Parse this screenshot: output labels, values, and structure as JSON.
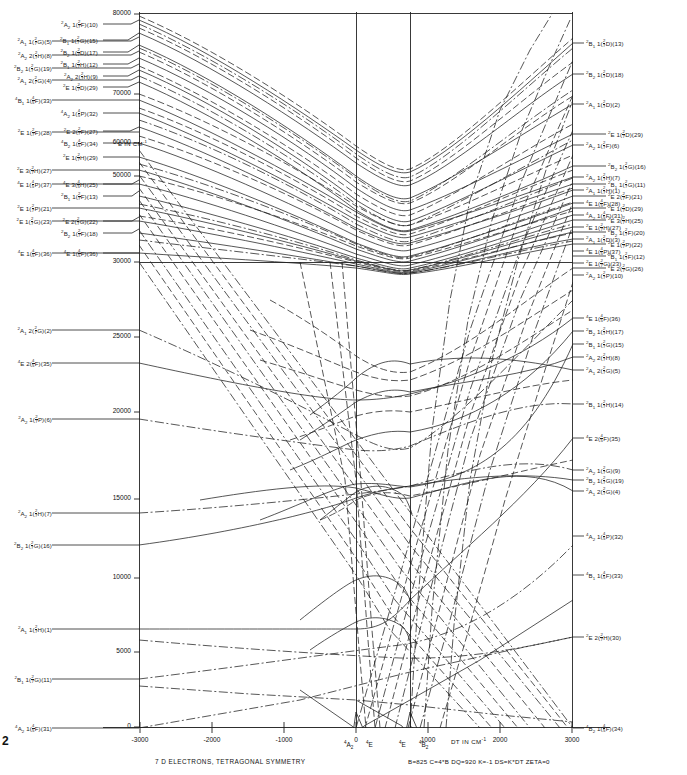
{
  "figure": {
    "caption": "7 D ELECTRONS, TETRAGONAL SYMMETRY",
    "parameters": "B=825   C=4*B   DQ=920    K=-1  DS=K*DT   ZETA=0",
    "page_number": "2",
    "energy_axis_note": "E IN CM",
    "energy_axis_note_sup": "-1",
    "xaxis_title": "DT IN CM",
    "xaxis_title_sup": "-1",
    "crossing_labels": [
      {
        "text": "4A2",
        "super": "4",
        "main": "A",
        "sub": "2",
        "x": 352,
        "y": 741
      },
      {
        "text": "4E",
        "super": "4",
        "main": "E",
        "sub": "",
        "x": 372,
        "y": 741
      },
      {
        "text": "4E",
        "super": "4",
        "main": "E",
        "sub": "",
        "x": 409,
        "y": 741
      },
      {
        "text": "4B2",
        "super": "4",
        "main": "B",
        "sub": "2",
        "x": 428,
        "y": 741
      }
    ]
  },
  "chart_data": {
    "type": "line",
    "title": "7 D ELECTRONS, TETRAGONAL SYMMETRY",
    "xlabel": "DT IN CM-1",
    "ylabel": "E IN CM-1",
    "xlim": [
      -3500,
      3500
    ],
    "ylim": [
      0,
      80000
    ],
    "xticks": [
      -3000,
      -2000,
      -1000,
      0,
      1000,
      2000,
      3000
    ],
    "xtick_labels": [
      "-3000",
      "-2000",
      "-1000",
      "0",
      "1000",
      "2000",
      "3000"
    ],
    "yticks": [
      0,
      5000,
      10000,
      15000,
      20000,
      25000,
      30000,
      50000,
      60000,
      70000,
      80000
    ],
    "ytick_labels": [
      "0",
      "5000",
      "10000",
      "15000",
      "20000",
      "25000",
      "30000",
      "50000",
      "60000",
      "70000",
      "80000"
    ],
    "grid": "vertical gridlines at -500, 0, 3000; horizontal at 30000",
    "legend": "none"
  },
  "yaxis": {
    "ticks": [
      {
        "label": "80000",
        "y": 14
      },
      {
        "label": "70000",
        "y": 94
      },
      {
        "label": "60000",
        "y": 143
      },
      {
        "label": "50000",
        "y": 176
      },
      {
        "label": "30000",
        "y": 262
      },
      {
        "label": "25000",
        "y": 337
      },
      {
        "label": "20000",
        "y": 412
      },
      {
        "label": "15000",
        "y": 499
      },
      {
        "label": "10000",
        "y": 578
      },
      {
        "label": "5000",
        "y": 652
      },
      {
        "label": "0",
        "y": 727
      }
    ]
  },
  "xaxis": {
    "ticks": [
      {
        "label": "-3000",
        "x": 140
      },
      {
        "label": "-2000",
        "x": 212
      },
      {
        "label": "-1000",
        "x": 284
      },
      {
        "label": "0",
        "x": 356
      },
      {
        "label": "1000",
        "x": 428
      },
      {
        "label": "2000",
        "x": 500
      },
      {
        "label": "3000",
        "x": 572
      }
    ]
  },
  "left_labels": [
    {
      "mult": "2",
      "sym": "A",
      "symsub": "1",
      "term": "1",
      "tmult": "2",
      "tden": "7",
      "tl": "G",
      "idx": "(5)",
      "x": 10,
      "y": 41
    },
    {
      "mult": "2",
      "sym": "A",
      "symsub": "2",
      "term": "2",
      "tmult": "2",
      "tden": "7",
      "tl": "H",
      "idx": "(8)",
      "x": 10,
      "y": 55
    },
    {
      "mult": "2",
      "sym": "B",
      "symsub": "2",
      "term": "1",
      "tmult": "2",
      "tden": "7",
      "tl": "G",
      "idx": "(19)",
      "x": 10,
      "y": 68
    },
    {
      "mult": "2",
      "sym": "A",
      "symsub": "1",
      "term": "2",
      "tmult": "2",
      "tden": "7",
      "tl": "G",
      "idx": "(4)",
      "x": 10,
      "y": 80
    },
    {
      "mult": "4",
      "sym": "B",
      "symsub": "1",
      "term": "1",
      "tmult": "4",
      "tden": "5",
      "tl": "F",
      "idx": "(33)",
      "x": 10,
      "y": 100
    },
    {
      "mult": "2",
      "sym": "E",
      "symsub": "",
      "term": "1",
      "tmult": "2",
      "tden": "7",
      "tl": "F",
      "idx": "(28)",
      "x": 10,
      "y": 132
    },
    {
      "mult": "2",
      "sym": "E",
      "symsub": "",
      "term": "3",
      "tmult": "2",
      "tden": "7",
      "tl": "H",
      "idx": "(27)",
      "x": 10,
      "y": 170
    },
    {
      "mult": "4",
      "sym": "E",
      "symsub": "",
      "term": "1",
      "tmult": "4",
      "tden": "5",
      "tl": "P",
      "idx": "(37)",
      "x": 10,
      "y": 184
    },
    {
      "mult": "2",
      "sym": "E",
      "symsub": "",
      "term": "1",
      "tmult": "2",
      "tden": "7",
      "tl": "P",
      "idx": "(21)",
      "x": 10,
      "y": 208
    },
    {
      "mult": "2",
      "sym": "E",
      "symsub": "",
      "term": "1",
      "tmult": "2",
      "tden": "7",
      "tl": "G",
      "idx": "(23)",
      "x": 10,
      "y": 221
    },
    {
      "mult": "4",
      "sym": "E",
      "symsub": "",
      "term": "1",
      "tmult": "4",
      "tden": "5",
      "tl": "F",
      "idx": "(36)",
      "x": 10,
      "y": 253
    },
    {
      "mult": "2",
      "sym": "A",
      "symsub": "1",
      "term": "2",
      "tmult": "2",
      "tden": "7",
      "tl": "G",
      "idx": "(2)",
      "x": 10,
      "y": 330
    },
    {
      "mult": "4",
      "sym": "E",
      "symsub": "",
      "term": "2",
      "tmult": "4",
      "tden": "5",
      "tl": "F",
      "idx": "(35)",
      "x": 10,
      "y": 363
    },
    {
      "mult": "2",
      "sym": "A",
      "symsub": "2",
      "term": "1",
      "tmult": "2",
      "tden": "7",
      "tl": "P",
      "idx": "(6)",
      "x": 10,
      "y": 419
    },
    {
      "mult": "2",
      "sym": "A",
      "symsub": "2",
      "term": "1",
      "tmult": "2",
      "tden": "7",
      "tl": "H",
      "idx": "(7)",
      "x": 10,
      "y": 513
    },
    {
      "mult": "2",
      "sym": "B",
      "symsub": "2",
      "term": "1",
      "tmult": "2",
      "tden": "7",
      "tl": "G",
      "idx": "(16)",
      "x": 10,
      "y": 545
    },
    {
      "mult": "2",
      "sym": "A",
      "symsub": "1",
      "term": "1",
      "tmult": "2",
      "tden": "7",
      "tl": "H",
      "idx": "(1)",
      "x": 10,
      "y": 629
    },
    {
      "mult": "2",
      "sym": "B",
      "symsub": "1",
      "term": "1",
      "tmult": "2",
      "tden": "7",
      "tl": "G",
      "idx": "(11)",
      "x": 10,
      "y": 679
    },
    {
      "mult": "4",
      "sym": "A",
      "symsub": "2",
      "term": "1",
      "tmult": "4",
      "tden": "5",
      "tl": "F",
      "idx": "(31)",
      "x": 10,
      "y": 728
    }
  ],
  "inner_left_labels": [
    {
      "mult": "2",
      "sym": "A",
      "symsub": "2",
      "term": "1",
      "tmult": "2",
      "tden": "7",
      "tl": "F",
      "idx": "(10)",
      "x": 56,
      "y": 24
    },
    {
      "mult": "2",
      "sym": "B",
      "symsub": "1",
      "term": "1",
      "tmult": "2",
      "tden": "7",
      "tl": "G",
      "idx": "(15)",
      "x": 56,
      "y": 40
    },
    {
      "mult": "2",
      "sym": "B",
      "symsub": "2",
      "term": "1",
      "tmult": "2",
      "tden": "7",
      "tl": "D",
      "idx": "(17)",
      "x": 56,
      "y": 52
    },
    {
      "mult": "2",
      "sym": "B",
      "symsub": "1",
      "term": "1",
      "tmult": "2",
      "tden": "7",
      "tl": "H",
      "idx": "(12)",
      "x": 56,
      "y": 64
    },
    {
      "mult": "2",
      "sym": "A",
      "symsub": "2",
      "term": "2",
      "tmult": "2",
      "tden": "7",
      "tl": "H",
      "idx": "(9)",
      "x": 56,
      "y": 76
    },
    {
      "mult": "2",
      "sym": "E",
      "symsub": "",
      "term": "1",
      "tmult": "2",
      "tden": "7",
      "tl": "D",
      "idx": "(29)",
      "x": 56,
      "y": 87
    },
    {
      "mult": "4",
      "sym": "A",
      "symsub": "2",
      "term": "1",
      "tmult": "4",
      "tden": "5",
      "tl": "P",
      "idx": "(32)",
      "x": 56,
      "y": 113
    },
    {
      "mult": "2",
      "sym": "E",
      "symsub": "",
      "term": "2",
      "tmult": "2",
      "tden": "7",
      "tl": "F",
      "idx": "(27)",
      "x": 56,
      "y": 131
    },
    {
      "mult": "4",
      "sym": "B",
      "symsub": "2",
      "term": "1",
      "tmult": "4",
      "tden": "5",
      "tl": "F",
      "idx": "(34)",
      "x": 56,
      "y": 143
    },
    {
      "mult": "2",
      "sym": "E",
      "symsub": "",
      "term": "1",
      "tmult": "2",
      "tden": "7",
      "tl": "H",
      "idx": "(29)",
      "x": 56,
      "y": 157
    },
    {
      "mult": "4",
      "sym": "E",
      "symsub": "",
      "term": "3",
      "tmult": "4",
      "tden": "5",
      "tl": "H",
      "idx": "(25)",
      "x": 56,
      "y": 184
    },
    {
      "mult": "2",
      "sym": "B",
      "symsub": "1",
      "term": "1",
      "tmult": "2",
      "tden": "7",
      "tl": "F",
      "idx": "(13)",
      "x": 56,
      "y": 196
    },
    {
      "mult": "2",
      "sym": "E",
      "symsub": "",
      "term": "2",
      "tmult": "2",
      "tden": "7",
      "tl": "G",
      "idx": "(22)",
      "x": 56,
      "y": 221
    },
    {
      "mult": "2",
      "sym": "B",
      "symsub": "2",
      "term": "1",
      "tmult": "2",
      "tden": "7",
      "tl": "F",
      "idx": "(18)",
      "x": 56,
      "y": 233
    },
    {
      "mult": "4",
      "sym": "E",
      "symsub": "",
      "term": "1",
      "tmult": "4",
      "tden": "5",
      "tl": "F",
      "idx": "(36)",
      "x": 56,
      "y": 253
    }
  ],
  "right_labels": [
    {
      "mult": "2",
      "sym": "B",
      "symsub": "1",
      "term": "1",
      "tmult": "2",
      "tden": "7",
      "tl": "D",
      "idx": "(13)",
      "x": 586,
      "y": 43
    },
    {
      "mult": "2",
      "sym": "B",
      "symsub": "2",
      "term": "1",
      "tmult": "2",
      "tden": "7",
      "tl": "D",
      "idx": "(18)",
      "x": 586,
      "y": 74
    },
    {
      "mult": "2",
      "sym": "A",
      "symsub": "1",
      "term": "1",
      "tmult": "2",
      "tden": "7",
      "tl": "D",
      "idx": "(2)",
      "x": 586,
      "y": 104
    },
    {
      "mult": "2",
      "sym": "E",
      "symsub": "",
      "term": "1",
      "tmult": "2",
      "tden": "7",
      "tl": "D",
      "idx": "(29)",
      "x": 608,
      "y": 134
    },
    {
      "mult": "2",
      "sym": "A",
      "symsub": "2",
      "term": "1",
      "tmult": "2",
      "tden": "7",
      "tl": "F",
      "idx": "(6)",
      "x": 586,
      "y": 145
    },
    {
      "mult": "2",
      "sym": "B",
      "symsub": "2",
      "term": "1",
      "tmult": "2",
      "tden": "7",
      "tl": "G",
      "idx": "(16)",
      "x": 608,
      "y": 166
    },
    {
      "mult": "2",
      "sym": "A",
      "symsub": "2",
      "term": "1",
      "tmult": "2",
      "tden": "7",
      "tl": "H",
      "idx": "(7)",
      "x": 586,
      "y": 177
    },
    {
      "mult": "2",
      "sym": "B",
      "symsub": "1",
      "term": "1",
      "tmult": "2",
      "tden": "7",
      "tl": "G",
      "idx": "(11)",
      "x": 608,
      "y": 184
    },
    {
      "mult": "2",
      "sym": "A",
      "symsub": "1",
      "term": "1",
      "tmult": "2",
      "tden": "7",
      "tl": "H",
      "idx": "(1)",
      "x": 586,
      "y": 190
    },
    {
      "mult": "2",
      "sym": "E",
      "symsub": "",
      "term": "2",
      "tmult": "2",
      "tden": "7",
      "tl": "F",
      "idx": "(21)",
      "x": 608,
      "y": 196
    },
    {
      "mult": "4",
      "sym": "E",
      "symsub": "",
      "term": "1",
      "tmult": "4",
      "tden": "5",
      "tl": "F",
      "idx": "(28)",
      "x": 586,
      "y": 203
    },
    {
      "mult": "2",
      "sym": "E",
      "symsub": "",
      "term": "1",
      "tmult": "2",
      "tden": "7",
      "tl": "D",
      "idx": "(29)",
      "x": 608,
      "y": 208
    },
    {
      "mult": "4",
      "sym": "A",
      "symsub": "2",
      "term": "1",
      "tmult": "4",
      "tden": "5",
      "tl": "F",
      "idx": "(31)",
      "x": 586,
      "y": 215
    },
    {
      "mult": "2",
      "sym": "E",
      "symsub": "",
      "term": "3",
      "tmult": "2",
      "tden": "7",
      "tl": "H",
      "idx": "(25)",
      "x": 608,
      "y": 220
    },
    {
      "mult": "2",
      "sym": "E",
      "symsub": "",
      "term": "1",
      "tmult": "2",
      "tden": "7",
      "tl": "H",
      "idx": "(27)",
      "x": 586,
      "y": 227
    },
    {
      "mult": "2",
      "sym": "B",
      "symsub": "2",
      "term": "1",
      "tmult": "2",
      "tden": "7",
      "tl": "F",
      "idx": "(20)",
      "x": 608,
      "y": 232
    },
    {
      "mult": "2",
      "sym": "A",
      "symsub": "1",
      "term": "1",
      "tmult": "2",
      "tden": "7",
      "tl": "D",
      "idx": "(3)",
      "x": 586,
      "y": 239
    },
    {
      "mult": "2",
      "sym": "E",
      "symsub": "",
      "term": "1",
      "tmult": "2",
      "tden": "7",
      "tl": "P",
      "idx": "(22)",
      "x": 608,
      "y": 244
    },
    {
      "mult": "4",
      "sym": "E",
      "symsub": "",
      "term": "1",
      "tmult": "4",
      "tden": "5",
      "tl": "P",
      "idx": "(37)",
      "x": 586,
      "y": 251
    },
    {
      "mult": "2",
      "sym": "B",
      "symsub": "1",
      "term": "1",
      "tmult": "2",
      "tden": "7",
      "tl": "F",
      "idx": "(12)",
      "x": 608,
      "y": 256
    },
    {
      "mult": "2",
      "sym": "E",
      "symsub": "",
      "term": "1",
      "tmult": "2",
      "tden": "7",
      "tl": "G",
      "idx": "(23)",
      "x": 586,
      "y": 263
    },
    {
      "mult": "2",
      "sym": "E",
      "symsub": "",
      "term": "2",
      "tmult": "2",
      "tden": "7",
      "tl": "G",
      "idx": "(26)",
      "x": 608,
      "y": 268
    },
    {
      "mult": "2",
      "sym": "A",
      "symsub": "2",
      "term": "1",
      "tmult": "2",
      "tden": "7",
      "tl": "P",
      "idx": "(10)",
      "x": 586,
      "y": 275
    },
    {
      "mult": "4",
      "sym": "E",
      "symsub": "",
      "term": "1",
      "tmult": "4",
      "tden": "5",
      "tl": "F",
      "idx": "(36)",
      "x": 586,
      "y": 318
    },
    {
      "mult": "2",
      "sym": "B",
      "symsub": "2",
      "term": "1",
      "tmult": "2",
      "tden": "7",
      "tl": "H",
      "idx": "(17)",
      "x": 586,
      "y": 331
    },
    {
      "mult": "2",
      "sym": "B",
      "symsub": "1",
      "term": "1",
      "tmult": "2",
      "tden": "7",
      "tl": "G",
      "idx": "(15)",
      "x": 586,
      "y": 344
    },
    {
      "mult": "2",
      "sym": "A",
      "symsub": "2",
      "term": "2",
      "tmult": "2",
      "tden": "7",
      "tl": "H",
      "idx": "(8)",
      "x": 586,
      "y": 357
    },
    {
      "mult": "2",
      "sym": "A",
      "symsub": "1",
      "term": "2",
      "tmult": "2",
      "tden": "7",
      "tl": "G",
      "idx": "(5)",
      "x": 586,
      "y": 370
    },
    {
      "mult": "2",
      "sym": "B",
      "symsub": "1",
      "term": "1",
      "tmult": "2",
      "tden": "7",
      "tl": "H",
      "idx": "(14)",
      "x": 586,
      "y": 404
    },
    {
      "mult": "4",
      "sym": "E",
      "symsub": "",
      "term": "2",
      "tmult": "4",
      "tden": "5",
      "tl": "F",
      "idx": "(35)",
      "x": 586,
      "y": 438
    },
    {
      "mult": "2",
      "sym": "A",
      "symsub": "2",
      "term": "1",
      "tmult": "2",
      "tden": "7",
      "tl": "G",
      "idx": "(9)",
      "x": 586,
      "y": 470
    },
    {
      "mult": "2",
      "sym": "B",
      "symsub": "2",
      "term": "1",
      "tmult": "2",
      "tden": "7",
      "tl": "G",
      "idx": "(19)",
      "x": 586,
      "y": 480
    },
    {
      "mult": "2",
      "sym": "A",
      "symsub": "1",
      "term": "2",
      "tmult": "2",
      "tden": "7",
      "tl": "G",
      "idx": "(4)",
      "x": 586,
      "y": 491
    },
    {
      "mult": "4",
      "sym": "A",
      "symsub": "2",
      "term": "1",
      "tmult": "4",
      "tden": "5",
      "tl": "P",
      "idx": "(32)",
      "x": 586,
      "y": 536
    },
    {
      "mult": "4",
      "sym": "B",
      "symsub": "1",
      "term": "1",
      "tmult": "4",
      "tden": "5",
      "tl": "F",
      "idx": "(33)",
      "x": 586,
      "y": 575
    },
    {
      "mult": "2",
      "sym": "E",
      "symsub": "",
      "term": "2",
      "tmult": "2",
      "tden": "7",
      "tl": "H",
      "idx": "(30)",
      "x": 586,
      "y": 637
    },
    {
      "mult": "4",
      "sym": "B",
      "symsub": "2",
      "term": "1",
      "tmult": "4",
      "tden": "5",
      "tl": "F",
      "idx": "(34)",
      "x": 586,
      "y": 728
    }
  ]
}
